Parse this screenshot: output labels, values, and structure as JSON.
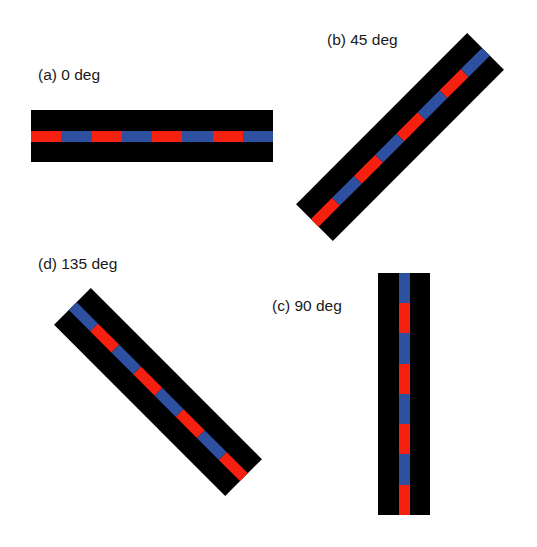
{
  "colors": {
    "background": "#ffffff",
    "bar": "#000000",
    "red": "#f5200f",
    "blue": "#2d50a0"
  },
  "panels": [
    {
      "id": "a",
      "label": "(a) 0 deg",
      "angle_deg": 0,
      "label_pos": [
        38,
        67
      ],
      "center": [
        152,
        136
      ]
    },
    {
      "id": "b",
      "label": "(b) 45 deg",
      "angle_deg": 45,
      "label_pos": [
        327,
        32
      ],
      "center": [
        400,
        137
      ]
    },
    {
      "id": "c",
      "label": "(c) 90 deg",
      "angle_deg": 90,
      "label_pos": [
        272,
        298
      ],
      "center": [
        404,
        394
      ]
    },
    {
      "id": "d",
      "label": "(d) 135 deg",
      "angle_deg": 135,
      "label_pos": [
        38,
        256
      ],
      "center": [
        158,
        392
      ]
    }
  ],
  "bar": {
    "length": 242,
    "thickness": 52,
    "stripe_offset": 21,
    "stripe_thickness": 11,
    "segments": [
      "red",
      "blue",
      "red",
      "blue",
      "red",
      "blue",
      "red",
      "blue"
    ]
  }
}
